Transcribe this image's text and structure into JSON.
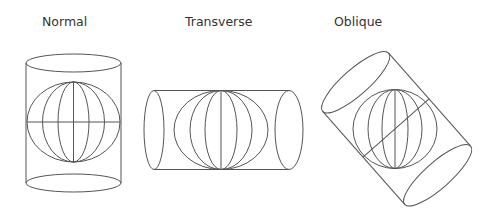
{
  "diagram": {
    "panels": [
      {
        "label": "Normal",
        "orientation": "vertical cylinder, axis aligned with globe's polar axis"
      },
      {
        "label": "Transverse",
        "orientation": "horizontal cylinder, axis perpendicular to polar axis"
      },
      {
        "label": "Oblique",
        "orientation": "tilted cylinder, axis at an angle to polar axis"
      }
    ]
  },
  "colors": {
    "stroke": "#555555",
    "text": "#333333",
    "background": "#ffffff"
  }
}
